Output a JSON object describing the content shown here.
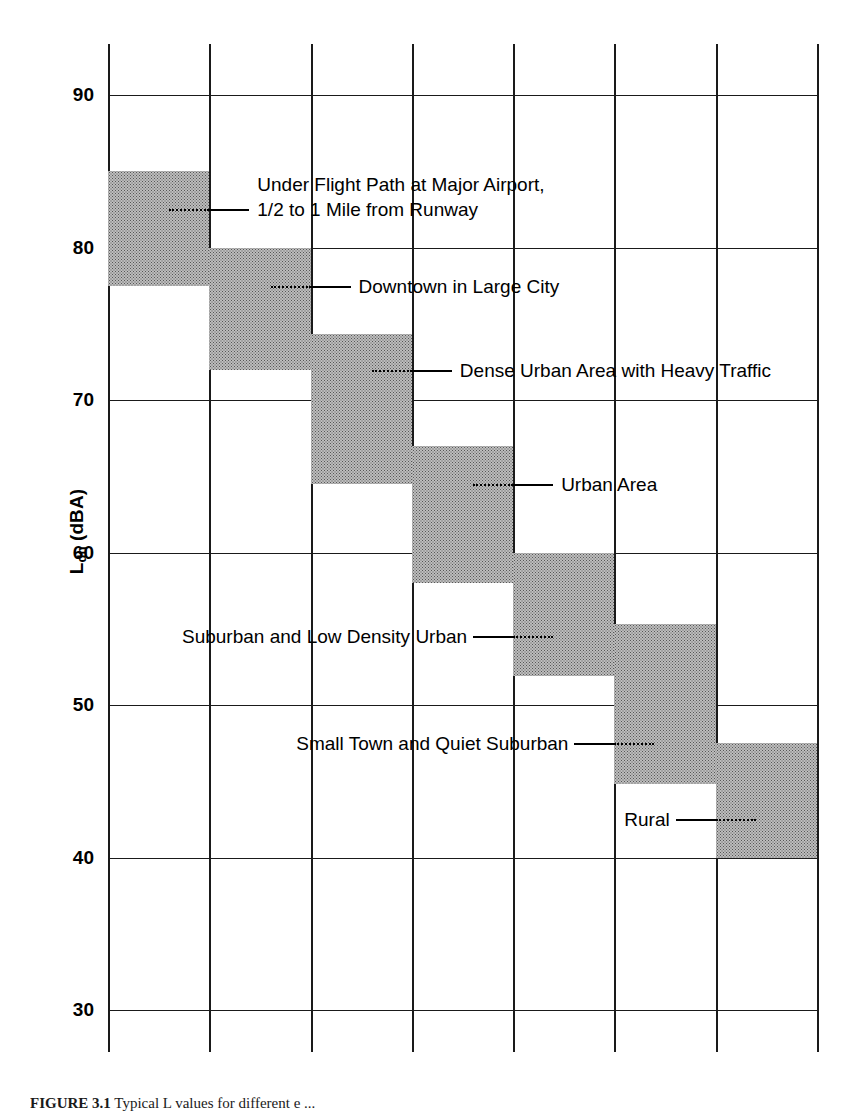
{
  "chart_data": {
    "type": "bar",
    "orientation": "vertical-range",
    "title": "",
    "xlabel": "",
    "ylabel": "L_dn (dBA)",
    "ylabel_main": "L",
    "ylabel_sub": "dn",
    "ylabel_unit": " (dBA)",
    "ylim": [
      30,
      90
    ],
    "ytick_values": [
      90,
      80,
      70,
      60,
      50,
      40,
      30
    ],
    "ytick_labels": [
      "90",
      "80",
      "70",
      "60",
      "50",
      "40",
      "30"
    ],
    "grid": true,
    "grid_vertical_count": 8,
    "legend": "none",
    "categories": [
      "Under Flight Path at Major Airport, 1/2 to 1 Mile from Runway",
      "Downtown in Large City",
      "Dense Urban Area with Heavy Traffic",
      "Urban Area",
      "Suburban and Low Density Urban",
      "Small Town and Quiet Suburban",
      "Rural"
    ],
    "ranges": [
      {
        "label_line1": "Under Flight Path at Major Airport,",
        "label_line2": "1/2 to 1 Mile from Runway",
        "low": 77.5,
        "high": 85.0,
        "leader_at": 82.5,
        "column": 1,
        "label_side": "right"
      },
      {
        "label_line1": "Downtown in Large City",
        "label_line2": "",
        "low": 72.0,
        "high": 80.0,
        "leader_at": 77.5,
        "column": 2,
        "label_side": "right"
      },
      {
        "label_line1": "Dense Urban Area with Heavy Traffic",
        "label_line2": "",
        "low": 64.5,
        "high": 74.3,
        "leader_at": 72.0,
        "column": 3,
        "label_side": "right"
      },
      {
        "label_line1": "Urban Area",
        "label_line2": "",
        "low": 58.0,
        "high": 67.0,
        "leader_at": 64.5,
        "column": 4,
        "label_side": "right"
      },
      {
        "label_line1": "Suburban and Low Density Urban",
        "label_line2": "",
        "low": 51.9,
        "high": 60.0,
        "leader_at": 54.5,
        "column": 5,
        "label_side": "left"
      },
      {
        "label_line1": "Small Town and Quiet Suburban",
        "label_line2": "",
        "low": 44.8,
        "high": 55.3,
        "leader_at": 47.5,
        "column": 6,
        "label_side": "left"
      },
      {
        "label_line1": "Rural",
        "label_line2": "",
        "low": 40.0,
        "high": 47.5,
        "leader_at": 42.5,
        "column": 7,
        "label_side": "left"
      }
    ],
    "colors": {
      "bar_fill": "#bdbdbd",
      "bar_dot": "#565656",
      "axis": "#1a1a1a",
      "text": "#000000",
      "background": "#ffffff"
    }
  },
  "caption": {
    "figure_number": "FIGURE 3.1",
    "text": "Typical L    values for different e      ..."
  }
}
